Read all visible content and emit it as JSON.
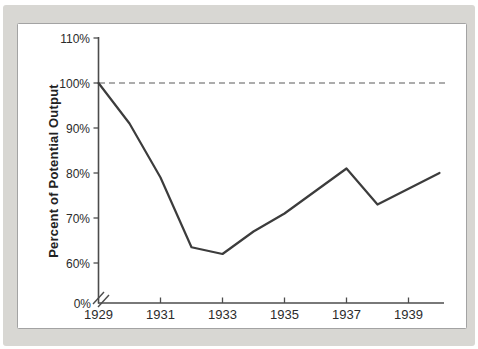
{
  "figure": {
    "kind": "textbook-economics-line-chart",
    "colors": {
      "backdrop": "#d8d7d3",
      "panel_background": "#ffffff",
      "panel_border": "#a3a3a3",
      "axis": "#4c4c4c",
      "data_line": "#3c3c3c",
      "reference_line": "#5a5a5a",
      "text": "#2b2b2b"
    }
  },
  "chart_data": {
    "type": "line",
    "title": "",
    "xlabel": "",
    "ylabel": "Percent of Potential Output",
    "series_name": "Actual output as percent of potential output",
    "x": [
      1929,
      1930,
      1931,
      1932,
      1933,
      1934,
      1935,
      1936,
      1937,
      1938,
      1939,
      1940
    ],
    "values": [
      100,
      91,
      79,
      63.5,
      62,
      67,
      71,
      76,
      81,
      73,
      76.5,
      80
    ],
    "x_axis": {
      "range": [
        1929,
        1940.2
      ],
      "tick_years": [
        1931,
        1933,
        1935,
        1937,
        1939
      ],
      "labeled_years": [
        1929,
        1931,
        1933,
        1935,
        1937,
        1939
      ],
      "labels": [
        "1929",
        "1931",
        "1933",
        "1935",
        "1937",
        "1939"
      ]
    },
    "y_axis": {
      "range_display": [
        60,
        110
      ],
      "axis_break_between": [
        0,
        60
      ],
      "ticks": [
        {
          "value": 110,
          "label": "110%"
        },
        {
          "value": 100,
          "label": "100%"
        },
        {
          "value": 90,
          "label": "90%"
        },
        {
          "value": 80,
          "label": "80%"
        },
        {
          "value": 70,
          "label": "70%"
        },
        {
          "value": 60,
          "label": "60%"
        },
        {
          "value": 0,
          "label": "0%"
        }
      ]
    },
    "reference_line": {
      "value": 100,
      "style": "dashed"
    },
    "grid": false,
    "legend": false
  }
}
